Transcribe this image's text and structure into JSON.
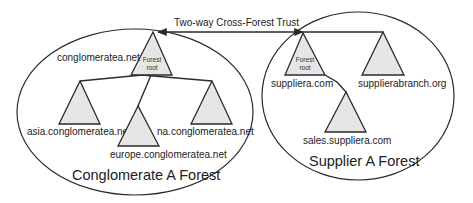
{
  "diagram": {
    "trust": {
      "label": "Two-way Cross-Forest Trust",
      "type": "two-way"
    },
    "forests": [
      {
        "id": "conglomerate",
        "title": "Conglomerate A Forest",
        "root": {
          "domain": "conglomeratea.net",
          "badge_line1": "Forest",
          "badge_line2": "root"
        },
        "children": [
          {
            "domain": "asia.conglomeratea.net"
          },
          {
            "domain": "europe.conglomeratea.net"
          },
          {
            "domain": "na.conglomeratea.net"
          }
        ]
      },
      {
        "id": "supplier",
        "title": "Supplier A Forest",
        "root": {
          "domain": "suppliera.com",
          "badge_line1": "Forest",
          "badge_line2": "root"
        },
        "trees": [
          {
            "domain": "supplierabranch.org"
          }
        ],
        "children": [
          {
            "domain": "sales.suppliera.com"
          }
        ]
      }
    ],
    "colors": {
      "stroke": "#2a2a2a",
      "triangle_fill": "#e6e6e6",
      "background": "#ffffff"
    }
  }
}
